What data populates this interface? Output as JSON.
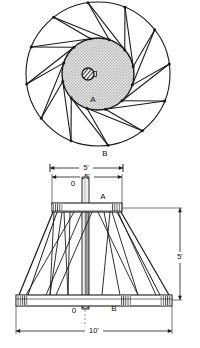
{
  "drawing": {
    "title": "Radial truss assembly - plan and elevation",
    "line_color": "#1a1a1a",
    "fill_disc_color": "#cfcfcf",
    "fill_plate_color": "#ffffff",
    "background": "#ffffff"
  },
  "plan_view": {
    "name": "plan-view",
    "center": {
      "x": 98,
      "y": 74
    },
    "outer_radius": 72,
    "inner_radius": 36,
    "blade_count": 12,
    "rotation_deg": -8,
    "inner_offset_deg": 26,
    "hub": {
      "x": 88,
      "y": 74,
      "r": 6,
      "tab_w": 4,
      "tab_h": 5
    },
    "labels": {
      "inner_disc": "A",
      "outer_ring": "B"
    },
    "label_positions": {
      "inner_disc": {
        "x": 93,
        "y": 102
      },
      "outer_ring": {
        "x": 105,
        "y": 156
      }
    }
  },
  "elevation_view": {
    "name": "elevation-view",
    "top_plate": {
      "x": 52,
      "y": 203,
      "w": 70,
      "h": 9
    },
    "bottom_plate": {
      "x": 16,
      "y": 295,
      "w": 156,
      "h": 11
    },
    "column": {
      "x": 82,
      "y": 177,
      "w": 7,
      "h": 132
    },
    "hatch_end_width": 10,
    "labels": {
      "top_post": "0",
      "top_plate": "A",
      "bottom_post": "0",
      "bottom_plate": "B"
    },
    "label_positions": {
      "top_post": {
        "x": 73,
        "y": 186
      },
      "top_plate": {
        "x": 103,
        "y": 199
      },
      "bottom_post": {
        "x": 74,
        "y": 313
      },
      "bottom_plate": {
        "x": 114,
        "y": 311
      }
    }
  },
  "dimensions": {
    "plan_width": {
      "name": "plan-diameter-dimension",
      "value": "5'",
      "x1": 50,
      "x2": 123,
      "y": 168,
      "text_x": 86,
      "text_y": 167
    },
    "top_width": {
      "name": "top-plate-width-dimension",
      "value": "5'",
      "x1": 52,
      "x2": 122,
      "y": 177,
      "text_x": 87,
      "text_y": 176
    },
    "overall_height": {
      "name": "overall-height-dimension",
      "value": "5'",
      "y1": 208,
      "y2": 300,
      "x": 180,
      "text_x": 184,
      "text_y": 256
    },
    "base_width": {
      "name": "base-width-dimension",
      "value": "10'",
      "x1": 16,
      "x2": 172,
      "y": 331,
      "text_x": 94,
      "text_y": 330
    }
  }
}
